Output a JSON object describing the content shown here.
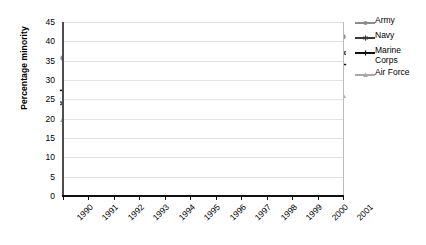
{
  "chart_data": {
    "type": "line",
    "title": "",
    "xlabel": "",
    "ylabel": "Percentage minority",
    "x": [
      "1990",
      "1991",
      "1992",
      "1993",
      "1994",
      "1995",
      "1996",
      "1997",
      "1998",
      "1999",
      "2000",
      "2001"
    ],
    "categories": [
      "1990",
      "1991",
      "1992",
      "1993",
      "1994",
      "1995",
      "1996",
      "1997",
      "1998",
      "1999",
      "2000",
      "2001"
    ],
    "ylim": [
      0,
      45
    ],
    "ytick_labels": [
      "0",
      "5",
      "10",
      "15",
      "20",
      "25",
      "30",
      "35",
      "40",
      "45"
    ],
    "ytick_values": [
      0,
      5,
      10,
      15,
      20,
      25,
      30,
      35,
      40,
      45
    ],
    "grid": "horizontal",
    "legend_position": "right",
    "series": [
      {
        "name": "Army",
        "color": "#8c8c8c",
        "marker": "circle",
        "values": [
          35.7,
          35.8,
          36.0,
          36.0,
          36.1,
          36.6,
          37.2,
          38.2,
          38.9,
          39.5,
          40.4,
          41.2
        ]
      },
      {
        "name": "Navy",
        "color": "#3a3a3a",
        "marker": "asterisk",
        "values": [
          24.0,
          24.7,
          25.4,
          26.0,
          27.2,
          28.6,
          29.9,
          31.3,
          32.6,
          34.0,
          35.4,
          37.0
        ]
      },
      {
        "name": "Marine Corps",
        "color": "#111111",
        "marker": "plus",
        "values": [
          27.3,
          27.2,
          27.0,
          26.8,
          27.2,
          28.6,
          29.6,
          30.5,
          31.3,
          32.1,
          33.0,
          34.0
        ]
      },
      {
        "name": "Air Force",
        "color": "#a8a8a8",
        "marker": "triangle",
        "values": [
          19.8,
          19.8,
          19.9,
          19.9,
          20.2,
          20.8,
          21.6,
          22.5,
          23.2,
          24.0,
          25.0,
          26.0
        ]
      }
    ]
  },
  "legend": {
    "items": [
      {
        "label": "Army"
      },
      {
        "label": "Navy"
      },
      {
        "label": "Marine Corps"
      },
      {
        "label": "Air Force"
      }
    ]
  }
}
